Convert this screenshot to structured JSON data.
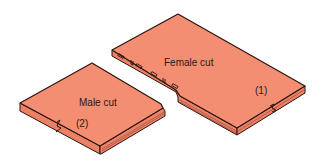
{
  "diagram": {
    "panels": [
      {
        "id": "female",
        "label": "Female cut",
        "number": "(1)"
      },
      {
        "id": "male",
        "label": "Male cut",
        "number": "(2)"
      }
    ],
    "colors": {
      "top_face": "#f48e72",
      "side_face": "#ec8166",
      "outline": "#2b1410",
      "background": "#ffffff"
    }
  }
}
